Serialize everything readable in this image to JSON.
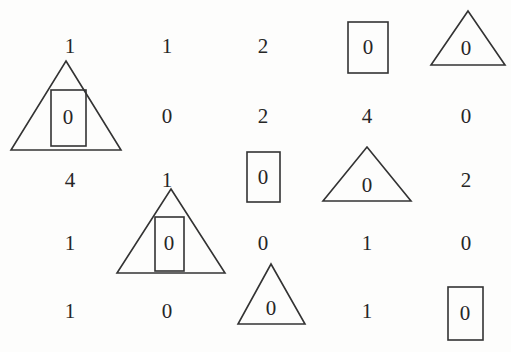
{
  "figure": {
    "type": "digit-grid-with-shape-annotations",
    "background_color": "#fdfdfc",
    "stroke_color": "#333333",
    "text_color": "#262626",
    "rows": 5,
    "columns": 5
  },
  "grid": {
    "row_y": [
      46,
      116,
      180,
      243,
      311
    ],
    "col_x": [
      70,
      167,
      263,
      367,
      466
    ],
    "cells": [
      [
        {
          "value": "1",
          "shape": "none"
        },
        {
          "value": "1",
          "shape": "none"
        },
        {
          "value": "2",
          "shape": "none"
        },
        {
          "value": "0",
          "shape": "rectangle"
        },
        {
          "value": "0",
          "shape": "triangle"
        }
      ],
      [
        {
          "value": "0",
          "shape": "rectangle-in-triangle"
        },
        {
          "value": "0",
          "shape": "none"
        },
        {
          "value": "2",
          "shape": "none"
        },
        {
          "value": "4",
          "shape": "none"
        },
        {
          "value": "0",
          "shape": "none"
        }
      ],
      [
        {
          "value": "4",
          "shape": "none"
        },
        {
          "value": "1",
          "shape": "none"
        },
        {
          "value": "0",
          "shape": "rectangle"
        },
        {
          "value": "0",
          "shape": "triangle"
        },
        {
          "value": "2",
          "shape": "none"
        }
      ],
      [
        {
          "value": "1",
          "shape": "none"
        },
        {
          "value": "0",
          "shape": "rectangle-in-triangle"
        },
        {
          "value": "0",
          "shape": "none"
        },
        {
          "value": "1",
          "shape": "none"
        },
        {
          "value": "0",
          "shape": "none"
        }
      ],
      [
        {
          "value": "1",
          "shape": "none"
        },
        {
          "value": "0",
          "shape": "none"
        },
        {
          "value": "0",
          "shape": "triangle"
        },
        {
          "value": "1",
          "shape": "none"
        },
        {
          "value": "0",
          "shape": "rectangle"
        }
      ]
    ]
  },
  "shapes": {
    "triangle_row1_col5": {
      "name": "triangle",
      "points": "468,11 505,65 431,65"
    },
    "rectangle_row1_col4": {
      "name": "rectangle",
      "x": 348,
      "y": 22,
      "width": 40,
      "height": 51
    },
    "triangle_row2_col1": {
      "name": "triangle",
      "points": "66,61 121,150 11,150"
    },
    "rectangle_row2_col1": {
      "name": "rectangle",
      "x": 51,
      "y": 90,
      "width": 35,
      "height": 56
    },
    "triangle_row3_col4": {
      "name": "triangle",
      "points": "367,147 411,201 323,201"
    },
    "rectangle_row3_col3": {
      "name": "rectangle",
      "x": 247,
      "y": 152,
      "width": 33,
      "height": 50
    },
    "triangle_row4_col2": {
      "name": "triangle",
      "points": "171,189 225,273 117,273"
    },
    "rectangle_row4_col2": {
      "name": "rectangle",
      "x": 155,
      "y": 217,
      "width": 29,
      "height": 54
    },
    "triangle_row5_col3": {
      "name": "triangle",
      "points": "271,264 305,324 238,324"
    },
    "rectangle_row5_col5": {
      "name": "rectangle",
      "x": 448,
      "y": 287,
      "width": 35,
      "height": 53
    }
  },
  "annotations": {
    "triangle_digit_offsets": {
      "triangle_row1_col5": {
        "x": 466,
        "y": 48
      },
      "triangle_row3_col4": {
        "x": 367,
        "y": 185
      },
      "triangle_row5_col3": {
        "x": 271,
        "y": 308
      }
    },
    "rectangle_digit_offsets": {
      "rectangle_row1_col4": {
        "x": 368,
        "y": 47
      },
      "rectangle_row2_col1": {
        "x": 68,
        "y": 117
      },
      "rectangle_row3_col3": {
        "x": 263,
        "y": 177
      },
      "rectangle_row4_col2": {
        "x": 169,
        "y": 243
      },
      "rectangle_row5_col5": {
        "x": 465,
        "y": 313
      }
    }
  }
}
